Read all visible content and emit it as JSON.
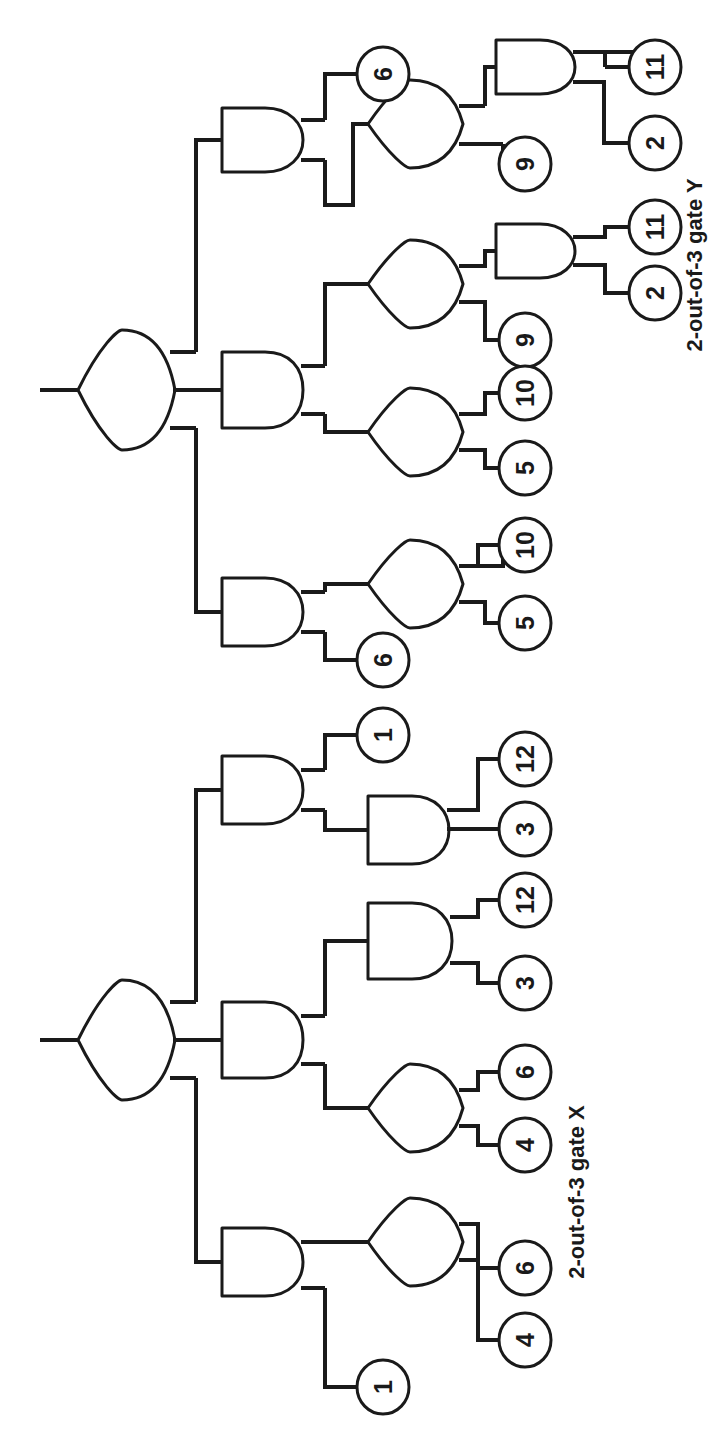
{
  "figure": {
    "orientation": "rotated-90-clockwise",
    "background_color": "#ffffff",
    "line_color": "#1a1a1a"
  },
  "captions": [
    {
      "id": "caption-y",
      "text": "2-out-of-3 gate Y"
    },
    {
      "id": "caption-x",
      "text": "2-out-of-3 gate X"
    }
  ],
  "trees": [
    {
      "id": "gate-Y",
      "name": "2-out-of-3 gate Y",
      "root": {
        "id": "Y-root",
        "type": "OR",
        "inputs": [
          {
            "id": "Y-A1",
            "type": "AND",
            "inputs": [
              {
                "id": "Y-E-6a",
                "type": "BASIC",
                "label": "6"
              },
              {
                "id": "Y-O1",
                "type": "OR",
                "inputs": [
                  {
                    "id": "Y-A2",
                    "type": "AND",
                    "inputs": [
                      {
                        "id": "Y-E-11a",
                        "type": "BASIC",
                        "label": "11"
                      },
                      {
                        "id": "Y-E-2a",
                        "type": "BASIC",
                        "label": "2"
                      }
                    ]
                  },
                  {
                    "id": "Y-E-9a",
                    "type": "BASIC",
                    "label": "9"
                  }
                ]
              }
            ]
          },
          {
            "id": "Y-A3",
            "type": "AND",
            "inputs": [
              {
                "id": "Y-O2",
                "type": "OR",
                "inputs": [
                  {
                    "id": "Y-A4",
                    "type": "AND",
                    "inputs": [
                      {
                        "id": "Y-E-11b",
                        "type": "BASIC",
                        "label": "11"
                      },
                      {
                        "id": "Y-E-2b",
                        "type": "BASIC",
                        "label": "2"
                      }
                    ]
                  },
                  {
                    "id": "Y-E-9b",
                    "type": "BASIC",
                    "label": "9"
                  }
                ]
              },
              {
                "id": "Y-O3",
                "type": "OR",
                "inputs": [
                  {
                    "id": "Y-E-10a",
                    "type": "BASIC",
                    "label": "10"
                  },
                  {
                    "id": "Y-E-5a",
                    "type": "BASIC",
                    "label": "5"
                  }
                ]
              }
            ]
          },
          {
            "id": "Y-A5",
            "type": "AND",
            "inputs": [
              {
                "id": "Y-O4",
                "type": "OR",
                "inputs": [
                  {
                    "id": "Y-E-10b",
                    "type": "BASIC",
                    "label": "10"
                  },
                  {
                    "id": "Y-E-5b",
                    "type": "BASIC",
                    "label": "5"
                  }
                ]
              },
              {
                "id": "Y-E-6b",
                "type": "BASIC",
                "label": "6"
              }
            ]
          }
        ]
      }
    },
    {
      "id": "gate-X",
      "name": "2-out-of-3 gate X",
      "root": {
        "id": "X-root",
        "type": "OR",
        "inputs": [
          {
            "id": "X-A1",
            "type": "AND",
            "inputs": [
              {
                "id": "X-E-1a",
                "type": "BASIC",
                "label": "1"
              },
              {
                "id": "X-A2",
                "type": "AND",
                "inputs": [
                  {
                    "id": "X-E-12a",
                    "type": "BASIC",
                    "label": "12"
                  },
                  {
                    "id": "X-E-3a",
                    "type": "BASIC",
                    "label": "3"
                  }
                ]
              }
            ]
          },
          {
            "id": "X-A3",
            "type": "AND",
            "inputs": [
              {
                "id": "X-A4",
                "type": "AND",
                "inputs": [
                  {
                    "id": "X-E-12b",
                    "type": "BASIC",
                    "label": "12"
                  },
                  {
                    "id": "X-E-3b",
                    "type": "BASIC",
                    "label": "3"
                  }
                ]
              },
              {
                "id": "X-O1",
                "type": "OR",
                "inputs": [
                  {
                    "id": "X-E-6a",
                    "type": "BASIC",
                    "label": "6"
                  },
                  {
                    "id": "X-E-4a",
                    "type": "BASIC",
                    "label": "4"
                  }
                ]
              }
            ]
          },
          {
            "id": "X-A5",
            "type": "AND",
            "inputs": [
              {
                "id": "X-O2",
                "type": "OR",
                "inputs": [
                  {
                    "id": "X-E-6b",
                    "type": "BASIC",
                    "label": "6"
                  },
                  {
                    "id": "X-E-4b",
                    "type": "BASIC",
                    "label": "4"
                  }
                ]
              },
              {
                "id": "X-E-1b",
                "type": "BASIC",
                "label": "1"
              }
            ]
          }
        ]
      }
    }
  ],
  "basic_events": [
    {
      "id": "ev-y-6a",
      "label": "6",
      "cx": 383,
      "cy": 74,
      "tree": "Y"
    },
    {
      "id": "ev-y-11a",
      "label": "11",
      "cx": 655,
      "cy": 67,
      "tree": "Y"
    },
    {
      "id": "ev-y-2a",
      "label": "2",
      "cx": 655,
      "cy": 143,
      "tree": "Y"
    },
    {
      "id": "ev-y-9a",
      "label": "9",
      "cx": 525,
      "cy": 164,
      "tree": "Y"
    },
    {
      "id": "ev-y-11b",
      "label": "11",
      "cx": 655,
      "cy": 227,
      "tree": "Y"
    },
    {
      "id": "ev-y-2b",
      "label": "2",
      "cx": 655,
      "cy": 293,
      "tree": "Y"
    },
    {
      "id": "ev-y-9b",
      "label": "9",
      "cx": 525,
      "cy": 340,
      "tree": "Y"
    },
    {
      "id": "ev-y-10a",
      "label": "10",
      "cx": 525,
      "cy": 393,
      "tree": "Y"
    },
    {
      "id": "ev-y-5a",
      "label": "5",
      "cx": 525,
      "cy": 468,
      "tree": "Y"
    },
    {
      "id": "ev-y-10b",
      "label": "10",
      "cx": 525,
      "cy": 545,
      "tree": "Y"
    },
    {
      "id": "ev-y-5b",
      "label": "5",
      "cx": 525,
      "cy": 623,
      "tree": "Y"
    },
    {
      "id": "ev-y-6b",
      "label": "6",
      "cx": 383,
      "cy": 660,
      "tree": "Y"
    },
    {
      "id": "ev-x-1a",
      "label": "1",
      "cx": 383,
      "cy": 735,
      "tree": "X"
    },
    {
      "id": "ev-x-12a",
      "label": "12",
      "cx": 525,
      "cy": 759,
      "tree": "X"
    },
    {
      "id": "ev-x-3a",
      "label": "3",
      "cx": 525,
      "cy": 829,
      "tree": "X"
    },
    {
      "id": "ev-x-12b",
      "label": "12",
      "cx": 525,
      "cy": 900,
      "tree": "X"
    },
    {
      "id": "ev-x-3b",
      "label": "3",
      "cx": 525,
      "cy": 983,
      "tree": "X"
    },
    {
      "id": "ev-x-6a",
      "label": "6",
      "cx": 525,
      "cy": 1072,
      "tree": "X"
    },
    {
      "id": "ev-x-4a",
      "label": "4",
      "cx": 525,
      "cy": 1145,
      "tree": "X"
    },
    {
      "id": "ev-x-6b",
      "label": "6",
      "cx": 525,
      "cy": 1268,
      "tree": "X"
    },
    {
      "id": "ev-x-4b",
      "label": "4",
      "cx": 525,
      "cy": 1340,
      "tree": "X"
    },
    {
      "id": "ev-x-1b",
      "label": "1",
      "cx": 383,
      "cy": 1387,
      "tree": "X"
    }
  ],
  "gate_counts": {
    "or_gates": 10,
    "and_gates": 12,
    "basic_events": 22
  }
}
